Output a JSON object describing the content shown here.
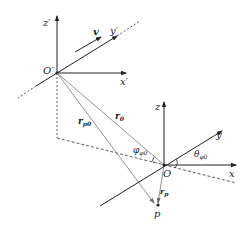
{
  "diagram": {
    "title": "",
    "frames": {
      "moving": {
        "origin_label": "O′",
        "axes": {
          "x": "x′",
          "y": "y′",
          "z": "z′"
        },
        "velocity_label": "v"
      },
      "fixed": {
        "origin_label": "O",
        "axes": {
          "x": "x",
          "y": "y",
          "z": "z"
        }
      }
    },
    "vectors": {
      "r0": {
        "base": "r",
        "sub": "0"
      },
      "rp0": {
        "base": "r",
        "sub": "p0"
      },
      "rp": {
        "base": "r",
        "sub": "p"
      }
    },
    "angles": {
      "phi": {
        "base": "φ",
        "sub": "φ0"
      },
      "theta": {
        "base": "θ",
        "sub": "φ0"
      }
    },
    "point": {
      "label": "p"
    },
    "colors": {
      "axis": "#222222",
      "ray": "#777777",
      "dashed": "#333333"
    }
  }
}
